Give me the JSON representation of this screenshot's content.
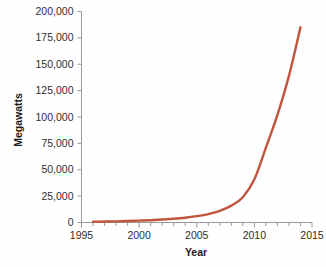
{
  "chart_data": {
    "type": "line",
    "title": "",
    "xlabel": "Year",
    "ylabel": "Megawatts",
    "xlim": [
      1995,
      2015
    ],
    "ylim": [
      0,
      200000
    ],
    "grid": false,
    "legend": "none",
    "line_color": "#c0543c",
    "axis_color": "#9b9b9b",
    "text_color": "#2e2e2e",
    "background": "#fefefe",
    "x_ticks_major": [
      1995,
      2000,
      2005,
      2010,
      2015
    ],
    "x_tick_labels": [
      "1995",
      "2000",
      "2005",
      "2010",
      "2015"
    ],
    "x_ticks_minor": [
      1996,
      1997,
      1998,
      1999,
      2001,
      2002,
      2003,
      2004,
      2006,
      2007,
      2008,
      2009,
      2011,
      2012,
      2013,
      2014
    ],
    "y_ticks": [
      0,
      25000,
      50000,
      75000,
      100000,
      125000,
      150000,
      175000,
      200000
    ],
    "y_tick_labels": [
      "0",
      "25,000",
      "50,000",
      "75,000",
      "100,000",
      "125,000",
      "150,000",
      "175,000",
      "200,000"
    ],
    "series": [
      {
        "name": "Installed capacity",
        "x": [
          1996,
          1997,
          1998,
          1999,
          2000,
          2001,
          2002,
          2003,
          2004,
          2005,
          2006,
          2007,
          2008,
          2009,
          2010,
          2011,
          2012,
          2013,
          2014
        ],
        "values": [
          700,
          900,
          1100,
          1400,
          1800,
          2200,
          2800,
          3500,
          4500,
          6000,
          8000,
          11000,
          16000,
          24000,
          41000,
          71000,
          102000,
          139000,
          185000
        ]
      }
    ]
  }
}
